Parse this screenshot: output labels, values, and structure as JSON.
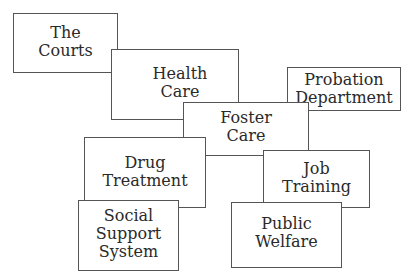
{
  "diagram": {
    "title": "",
    "center": "Foster Care",
    "boxes": [
      {
        "id": "courts",
        "label": "The\nCourts"
      },
      {
        "id": "health",
        "label": "Health\nCare"
      },
      {
        "id": "probation",
        "label": "Probation\nDepartment"
      },
      {
        "id": "foster",
        "label": "Foster\nCare"
      },
      {
        "id": "drug",
        "label": "Drug\nTreatment"
      },
      {
        "id": "job",
        "label": "Job\nTraining"
      },
      {
        "id": "social",
        "label": "Social\nSupport\nSystem"
      },
      {
        "id": "welfare",
        "label": "Public\nWelfare"
      }
    ]
  }
}
